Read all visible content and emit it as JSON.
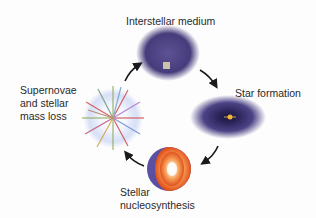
{
  "diagram": {
    "type": "cycle",
    "stages": [
      {
        "id": "interstellar-medium",
        "label": "Interstellar medium"
      },
      {
        "id": "star-formation",
        "label": "Star formation"
      },
      {
        "id": "stellar-nucleosynthesis",
        "label_line1": "Stellar",
        "label_line2": "nucleosynthesis"
      },
      {
        "id": "supernovae",
        "label_line1": "Supernovae",
        "label_line2": "and stellar",
        "label_line3": "mass loss"
      }
    ],
    "flow": [
      "interstellar-medium",
      "star-formation",
      "stellar-nucleosynthesis",
      "supernovae",
      "interstellar-medium"
    ],
    "colors": {
      "cloud": "#4a3f7e",
      "star_core_outer": "#e8561c",
      "star_core_inner": "#f6b06a",
      "star_shell": "#5a4fa0",
      "arrow": "#1a1a1a"
    }
  }
}
